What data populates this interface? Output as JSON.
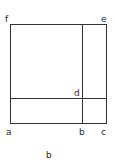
{
  "diagram": {
    "points": {
      "a": "a",
      "b": "b",
      "c": "c",
      "d": "d",
      "e": "e",
      "f": "f"
    },
    "caption": "b",
    "stroke_color": "#333333"
  }
}
